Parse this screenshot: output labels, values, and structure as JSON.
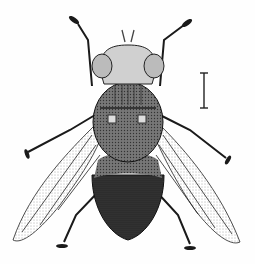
{
  "figure": {
    "scale_bar": {
      "present": true
    },
    "colors": {
      "ink": "#1a1a1a",
      "background": "#fefefe",
      "mid_gray": "#8a8a8a"
    }
  }
}
